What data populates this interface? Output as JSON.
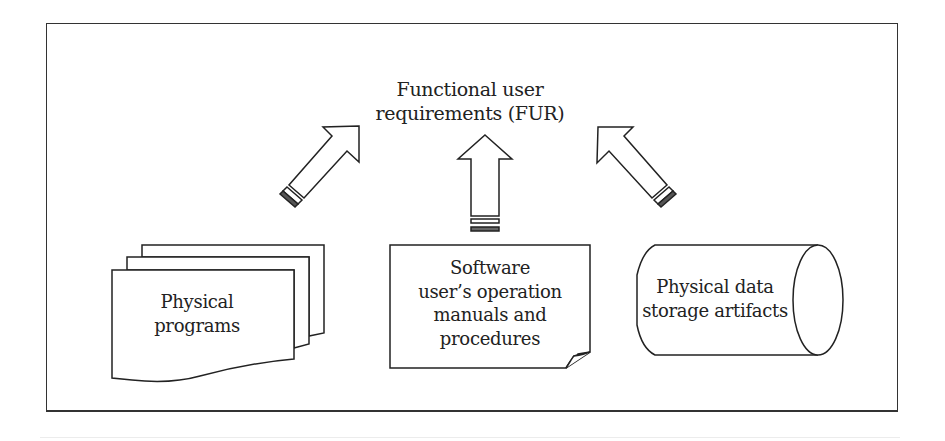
{
  "diagram": {
    "title": {
      "lines": [
        "Functional user",
        "requirements (FUR)"
      ]
    },
    "arrows": [
      {
        "name": "arrow-programs-to-fur",
        "direction": "up-right",
        "from": "physical_programs",
        "to": "fur"
      },
      {
        "name": "arrow-manuals-to-fur",
        "direction": "up",
        "from": "software_manuals",
        "to": "fur"
      },
      {
        "name": "arrow-storage-to-fur",
        "direction": "up-left",
        "from": "data_storage",
        "to": "fur"
      }
    ],
    "nodes": {
      "physical_programs": {
        "shape": "stacked-documents",
        "lines": [
          "Physical",
          "programs"
        ]
      },
      "software_manuals": {
        "shape": "document-curled-corner",
        "lines": [
          "Software",
          "user’s operation",
          "manuals and",
          "procedures"
        ]
      },
      "data_storage": {
        "shape": "cylinder",
        "lines": [
          "Physical data",
          "storage artifacts"
        ]
      }
    },
    "colors": {
      "stroke": "#222222",
      "fill": "#ffffff",
      "text": "#222222"
    }
  }
}
